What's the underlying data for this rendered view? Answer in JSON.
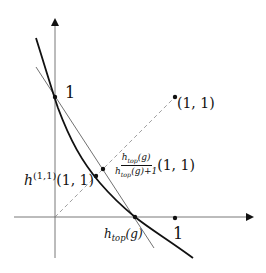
{
  "diagram": {
    "type": "function-plot",
    "axes": {
      "x_tick_label": "1",
      "y_tick_label": "1"
    },
    "labels": {
      "y_intercept": "1",
      "x_one": "1",
      "point_11": "(1, 1)",
      "h_top": "h",
      "h_top_sub": "top",
      "h_top_arg": "(g)",
      "h11_base": "h",
      "h11_sup": "(1,1)",
      "h11_arg": "(1, 1)",
      "frac_num_base": "h",
      "frac_num_sub": "top",
      "frac_num_arg": "(g)",
      "frac_den_base": "h",
      "frac_den_sub": "top",
      "frac_den_arg": "(g)+1",
      "frac_after": "(1, 1)"
    },
    "colors": {
      "ink": "#111111",
      "axis": "#555555",
      "dashed": "#888888"
    }
  }
}
